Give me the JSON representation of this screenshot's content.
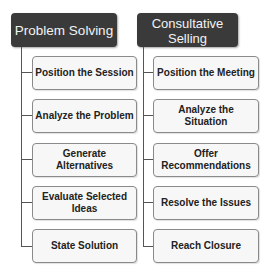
{
  "columns": [
    {
      "title": "Problem Solving",
      "steps": [
        "Position the Session",
        "Analyze the Problem",
        "Generate Alternatives",
        "Evaluate Selected Ideas",
        "State Solution"
      ]
    },
    {
      "title_lines": [
        "Consultative",
        "Selling"
      ],
      "title": "Consultative Selling",
      "steps": [
        "Position the Meeting",
        "Analyze the Situation",
        "Offer Recommendations",
        "Resolve the Issues",
        "Reach Closure"
      ]
    }
  ],
  "colors": {
    "header_bg": "#3a3a3a",
    "header_text": "#f2f2f2",
    "box_bg": "#f7f7f7",
    "box_border": "#8a8a8a",
    "connector": "#555555"
  }
}
